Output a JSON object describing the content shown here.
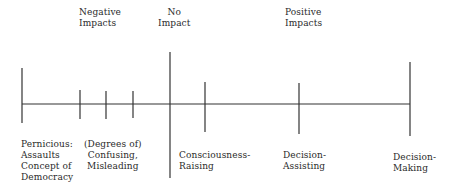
{
  "diagram": {
    "type": "impact-continuum",
    "top_labels": {
      "negative": "Negative\nImpacts",
      "none": "No\nImpact",
      "positive": "Positive\nImpacts"
    },
    "bottom_labels": {
      "pernicious": "Pernicious:\nAssaults\nConcept of\nDemocracy",
      "confusing": "(Degrees of)\nConfusing,\nMisleading",
      "consciousness": "Consciousness-\nRaising",
      "assisting": "Decision-\nAssisting",
      "making": "Decision-\nMaking"
    },
    "axis": {
      "x1": 22,
      "x2": 410,
      "y": 104,
      "color": "#333333"
    },
    "ticks": [
      {
        "name": "pernicious",
        "x": 22,
        "y1": 68,
        "y2": 123
      },
      {
        "name": "confusing-1",
        "x": 80,
        "y1": 90,
        "y2": 119
      },
      {
        "name": "confusing-2",
        "x": 106,
        "y1": 91,
        "y2": 119
      },
      {
        "name": "confusing-3",
        "x": 133,
        "y1": 91,
        "y2": 118
      },
      {
        "name": "no-impact",
        "x": 170,
        "y1": 52,
        "y2": 178
      },
      {
        "name": "consciousness-raising",
        "x": 205,
        "y1": 82,
        "y2": 132
      },
      {
        "name": "decision-assisting",
        "x": 299,
        "y1": 83,
        "y2": 134
      },
      {
        "name": "decision-making",
        "x": 410,
        "y1": 62,
        "y2": 136
      }
    ]
  }
}
